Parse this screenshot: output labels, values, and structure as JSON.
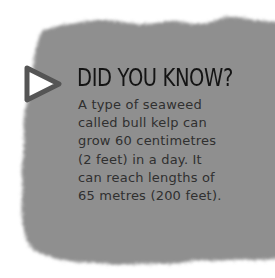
{
  "callout": {
    "heading": "DID YOU KNOW?",
    "lines": [
      "A type of seaweed",
      "called bull kelp can",
      "grow 60 centimetres",
      "(2 feet) in a day. It",
      "can reach lengths of",
      "65 metres (200 feet)."
    ],
    "icon": "triangle-pointer-icon",
    "colors": {
      "panel": "#8f8f8f",
      "heading": "#141414",
      "body": "#303030",
      "background": "#ffffff"
    }
  }
}
